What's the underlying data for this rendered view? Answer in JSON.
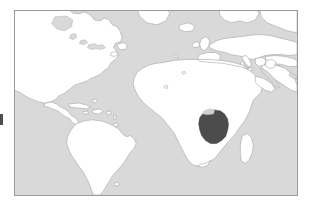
{
  "figure": {
    "type": "locator-map",
    "background_color": "#ffffff",
    "frame": {
      "border_color": "#9a9a9a",
      "border_width_px": 1,
      "left_px": 14,
      "top_px": 10,
      "width_px": 284,
      "height_px": 186
    }
  },
  "map": {
    "projection": "equirectangular",
    "center": "Atlantic Ocean",
    "extent_note": "Americas, Atlantic Ocean, Africa, Europe, Middle East",
    "ocean_color": "#d9d9d9",
    "land_color": "#ffffff",
    "land_outline_color": "#9e9e9e",
    "highlight_color": "#4c4c4c",
    "highlighted_country": "Tanzania",
    "highlighted_region": "East Africa",
    "legend": null,
    "labels": [],
    "landmasses": [
      "North America",
      "Central America",
      "Caribbean islands",
      "South America",
      "Greenland edge",
      "Europe",
      "Iberian Peninsula",
      "Italy",
      "Greece",
      "British Isles",
      "Africa",
      "Madagascar",
      "Arabian Peninsula",
      "Middle East",
      "Iceland"
    ],
    "marks": [
      {
        "name": "edge-artifact",
        "color": "#4e4e4e",
        "left_px": 0,
        "top_px": 114,
        "width_px": 3,
        "height_px": 11
      }
    ]
  }
}
